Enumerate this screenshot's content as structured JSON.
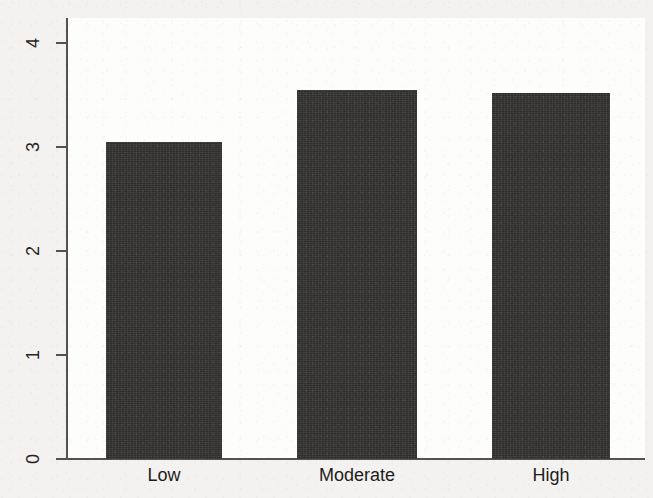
{
  "chart_data": {
    "type": "bar",
    "title": "",
    "subtitle": "",
    "xlabel": "",
    "ylabel": "",
    "categories": [
      "Low",
      "Moderate",
      "High"
    ],
    "values": [
      3.05,
      3.55,
      3.52
    ],
    "series": [
      {
        "name": "",
        "values": [
          3.05,
          3.55,
          3.52
        ]
      }
    ],
    "ylim": [
      0,
      4
    ],
    "xlim_note": "categorical",
    "yticks": [
      0,
      1,
      2,
      3,
      4
    ],
    "ytick_labels": [
      "0",
      "1",
      "2",
      "3",
      "4"
    ],
    "ytick_label_rotation": 90,
    "grid": false,
    "legend": false,
    "legend_position": "none",
    "bar_color": "#302e2d",
    "axis_color": "#555150",
    "plot_background": "#fdfdfc",
    "figure_background": "#f3f2f0",
    "spines": [
      "left",
      "bottom"
    ],
    "annotations": []
  },
  "axis": {
    "y_ticks": [
      {
        "label": "4",
        "value": 4
      },
      {
        "label": "3",
        "value": 3
      },
      {
        "label": "2",
        "value": 2
      },
      {
        "label": "1",
        "value": 1
      },
      {
        "label": "0",
        "value": 0
      }
    ]
  },
  "bars": [
    {
      "label": "Low",
      "value": 3.05
    },
    {
      "label": "Moderate",
      "value": 3.55
    },
    {
      "label": "High",
      "value": 3.52
    }
  ]
}
